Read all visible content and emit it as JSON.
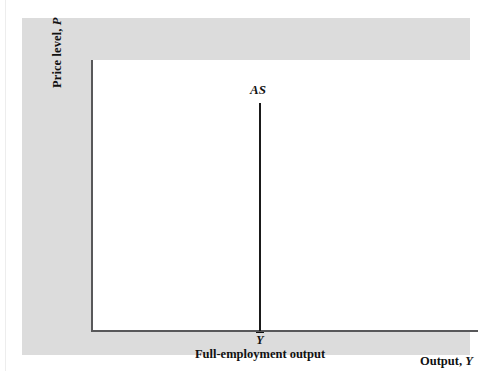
{
  "figure": {
    "kind": "economics-diagram"
  },
  "axes": {
    "y_label_text": "Price level, ",
    "y_label_variable": "P",
    "x_label_text": "Output, ",
    "x_label_variable": "Y"
  },
  "curve": {
    "label": "AS"
  },
  "annotations": {
    "ybar_symbol": "Y",
    "full_employment_caption": "Full-employment output"
  },
  "chart_data": {
    "type": "line",
    "title": "",
    "xlabel": "Output, Y",
    "ylabel": "Price level, P",
    "grid": false,
    "legend": "none",
    "xlim": [
      0,
      100
    ],
    "ylim": [
      0,
      100
    ],
    "axis_ticks": {
      "x": [
        "Y-bar"
      ],
      "y": []
    },
    "series": [
      {
        "name": "AS",
        "label": "AS",
        "description": "Vertical aggregate supply curve fixed at full-employment output",
        "x": [
          43.6,
          43.6
        ],
        "y": [
          0,
          84
        ]
      }
    ],
    "annotations": [
      {
        "text": "AS",
        "x": 43.6,
        "y": 90
      },
      {
        "text": "Y-bar",
        "x": 43.6,
        "y": -4
      },
      {
        "text": "Full-employment output",
        "x": 43.6,
        "y": -10
      }
    ]
  },
  "colors": {
    "panel_background": "#dcdcdc",
    "plot_background": "#ffffff",
    "axis_line": "#58585a",
    "curve_line": "#1a1a1a",
    "text": "#111111"
  }
}
